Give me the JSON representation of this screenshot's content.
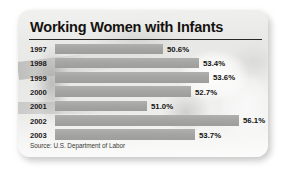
{
  "card": {
    "title": "Working Women with Infants",
    "source": "Source: U.S. Department of Labor"
  },
  "chart_data": {
    "type": "bar",
    "orientation": "horizontal",
    "title": "Working Women with Infants",
    "xlabel": "",
    "ylabel": "",
    "categories": [
      "1997",
      "1998",
      "1999",
      "2000",
      "2001",
      "2002",
      "2003"
    ],
    "values": [
      50.6,
      53.4,
      53.6,
      52.7,
      51.0,
      56.1,
      53.7
    ],
    "value_labels": [
      "50.6%",
      "53.4%",
      "53.6%",
      "52.7%",
      "51.0%",
      "56.1%",
      "53.7%"
    ],
    "unit": "%",
    "xlim": [
      47.0,
      57.0
    ],
    "grid": false,
    "legend": false,
    "bar_color": "#a5a5a4",
    "note": "Bars drawn against a suppressed baseline near 47%, so lengths show relative differences rather than absolute magnitude.",
    "source": "Source: U.S. Department of Labor"
  },
  "rows": [
    {
      "year": "1997",
      "value_label": "50.6%",
      "bar_pct": 54.0
    },
    {
      "year": "1998",
      "value_label": "53.4%",
      "bar_pct": 72.0
    },
    {
      "year": "1999",
      "value_label": "53.6%",
      "bar_pct": 77.0
    },
    {
      "year": "2000",
      "value_label": "52.7%",
      "bar_pct": 68.0
    },
    {
      "year": "2001",
      "value_label": "51.0%",
      "bar_pct": 46.0
    },
    {
      "year": "2002",
      "value_label": "56.1%",
      "bar_pct": 92.0
    },
    {
      "year": "2003",
      "value_label": "53.7%",
      "bar_pct": 70.0
    }
  ],
  "colors": {
    "bar": "#a5a5a4",
    "text": "#14120f",
    "rule": "#2a2724",
    "card_bg": "#f2f2f1"
  }
}
